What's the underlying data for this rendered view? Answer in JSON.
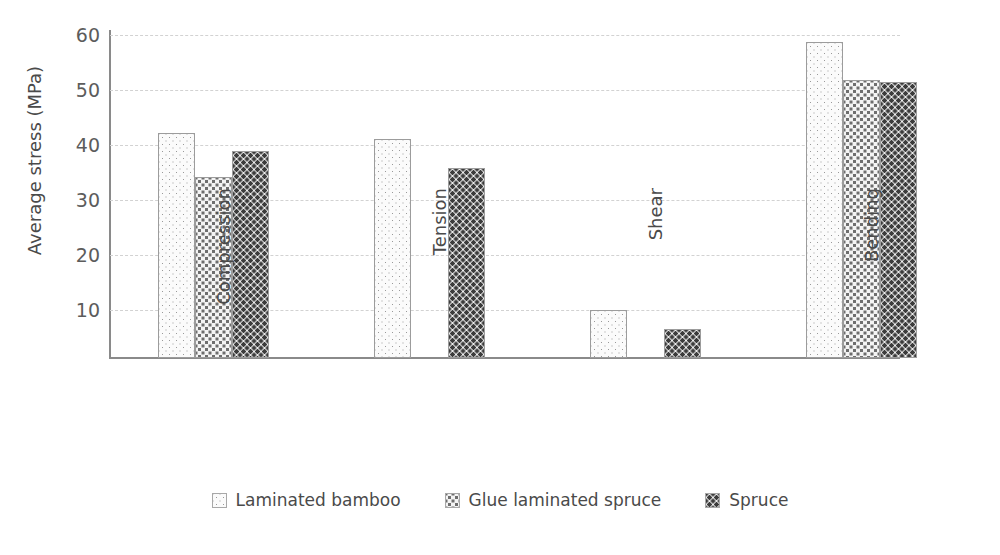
{
  "chart_data": {
    "type": "bar",
    "title": "",
    "subtitle": "",
    "xlabel": "",
    "ylabel": "Average stress (MPa)",
    "categories": [
      "Compression",
      "Tension",
      "Shear",
      "Bending"
    ],
    "series": [
      {
        "name": "Laminated bamboo",
        "pattern": "light-dots",
        "values": [
          41.0,
          39.9,
          8.8,
          57.5
        ]
      },
      {
        "name": "Glue laminated spruce",
        "pattern": "medium-dots",
        "values": [
          33.0,
          null,
          null,
          50.6
        ]
      },
      {
        "name": "Spruce",
        "pattern": "dense-dots",
        "values": [
          37.7,
          34.5,
          5.3,
          50.1
        ]
      }
    ],
    "ylim": [
      0,
      62
    ],
    "yticks": [
      10,
      20,
      30,
      40,
      50,
      60
    ],
    "ytick_labels": [
      "10",
      "20",
      "30",
      "40",
      "50",
      "60"
    ],
    "grid": "horizontal-dashed",
    "legend_position": "bottom-center",
    "colors": {
      "axis": "#8a8a8a",
      "gridline": "#d2d2d2",
      "text": "#4a4a4a",
      "tick_text": "#5c5c5c",
      "bar_border": "#9c9c9c",
      "series_1_dot": "#9a9a9a",
      "series_2_dot": "#6e6e6e",
      "series_3_dot": "#3c3c3c",
      "background": "#ffffff"
    }
  },
  "axis": {
    "y_title": "Average stress (MPa)",
    "y_tick_0": "10",
    "y_tick_1": "20",
    "y_tick_2": "30",
    "y_tick_3": "40",
    "y_tick_4": "50",
    "y_tick_5": "60"
  },
  "categories": {
    "cat_0": "Compression",
    "cat_1": "Tension",
    "cat_2": "Shear",
    "cat_3": "Bending"
  },
  "legend": {
    "items": [
      {
        "label": "Laminated bamboo"
      },
      {
        "label": "Glue laminated spruce"
      },
      {
        "label": "Spruce"
      }
    ],
    "item_0": "Laminated bamboo",
    "item_1": "Glue laminated spruce",
    "item_2": "Spruce"
  }
}
